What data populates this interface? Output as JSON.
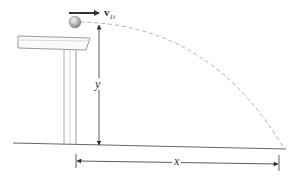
{
  "diagram": {
    "type": "projectile-motion",
    "labels": {
      "velocity": "v",
      "velocity_subscript": "1i",
      "height": "y",
      "range": "x"
    },
    "colors": {
      "line": "#555555",
      "table": "#9a9a9a",
      "trajectory": "#b0b0b0",
      "ball": "#a8a8a8",
      "arrow": "#333333"
    }
  }
}
